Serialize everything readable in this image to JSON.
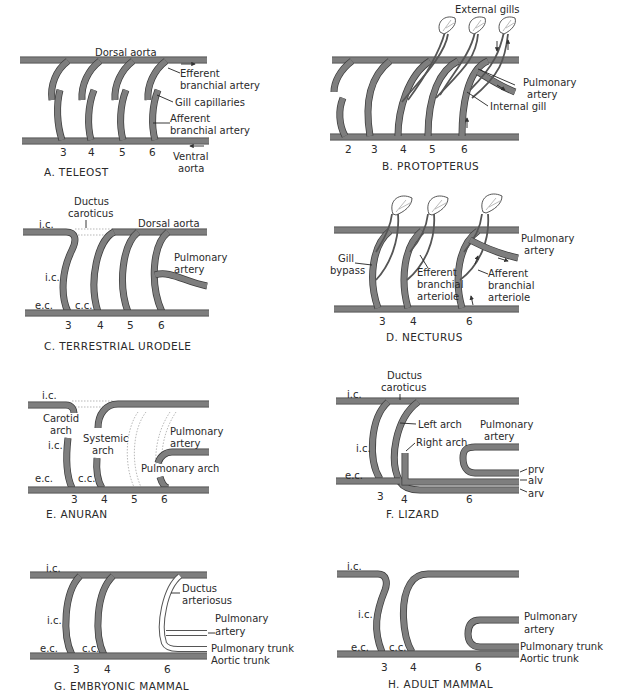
{
  "figure": {
    "vessel_color": "#7e7e7e",
    "panels": [
      {
        "id": "A",
        "caption": "A. TELEOST",
        "arch_numbers": [
          "3",
          "4",
          "5",
          "6"
        ],
        "labels": {
          "dorsal_aorta": "Dorsal aorta",
          "efferent_1": "Efferent",
          "efferent_2": "branchial artery",
          "gill_capillaries": "Gill capillaries",
          "afferent_1": "Afferent",
          "afferent_2": "branchial artery",
          "ventral_1": "Ventral",
          "ventral_2": "aorta"
        }
      },
      {
        "id": "B",
        "caption": "B. PROTOPTERUS",
        "arch_numbers": [
          "2",
          "3",
          "4",
          "5",
          "6"
        ],
        "labels": {
          "external_gills": "External gills",
          "pulmonary_1": "Pulmonary",
          "pulmonary_2": "artery",
          "internal_gill": "Internal gill"
        }
      },
      {
        "id": "C",
        "caption": "C. TERRESTRIAL URODELE",
        "arch_numbers": [
          "3",
          "4",
          "5",
          "6"
        ],
        "labels": {
          "ductus_1": "Ductus",
          "ductus_2": "caroticus",
          "dorsal_aorta": "Dorsal aorta",
          "ic_top": "i.c.",
          "ic_mid": "i.c.",
          "ec": "e.c.",
          "cc": "c.c.",
          "pulmonary_1": "Pulmonary",
          "pulmonary_2": "artery"
        }
      },
      {
        "id": "D",
        "caption": "D. NECTURUS",
        "arch_numbers": [
          "3",
          "4",
          "6"
        ],
        "labels": {
          "gill_bypass_1": "Gill",
          "gill_bypass_2": "bypass",
          "efferent_1": "Efferent",
          "efferent_2": "branchial",
          "efferent_3": "arteriole",
          "afferent_1": "Afferent",
          "afferent_2": "branchial",
          "afferent_3": "arteriole",
          "pulmonary_1": "Pulmonary",
          "pulmonary_2": "artery"
        }
      },
      {
        "id": "E",
        "caption": "E. ANURAN",
        "arch_numbers": [
          "3",
          "4",
          "5",
          "6"
        ],
        "labels": {
          "ic_top": "i.c.",
          "carotid_1": "Carotid",
          "carotid_2": "arch",
          "ic_mid": "i.c.",
          "systemic_1": "Systemic",
          "systemic_2": "arch",
          "ec": "e.c.",
          "cc": "c.c.",
          "pulmonary_1": "Pulmonary",
          "pulmonary_2": "artery",
          "pulmonary_arch": "Pulmonary arch"
        }
      },
      {
        "id": "F",
        "caption": "F. LIZARD",
        "arch_numbers": [
          "3",
          "4",
          "6"
        ],
        "labels": {
          "ductus_1": "Ductus",
          "ductus_2": "caroticus",
          "ic_top": "i.c.",
          "ic_mid": "i.c.",
          "ec": "e.c.",
          "left_arch": "Left arch",
          "right_arch": "Right arch",
          "pulmonary_1": "Pulmonary",
          "pulmonary_2": "artery",
          "prv": "prv",
          "alv": "alv",
          "arv": "arv"
        }
      },
      {
        "id": "G",
        "caption": "G. EMBRYONIC MAMMAL",
        "arch_numbers": [
          "3",
          "4",
          "6"
        ],
        "labels": {
          "ic_top": "i.c.",
          "ic_mid": "i.c.",
          "ec": "e.c.",
          "cc": "c.c.",
          "ductus_1": "Ductus",
          "ductus_2": "arteriosus",
          "pulmonary_1": "Pulmonary",
          "pulmonary_2": "artery",
          "pulmonary_trunk": "Pulmonary trunk",
          "aortic_trunk": "Aortic trunk"
        }
      },
      {
        "id": "H",
        "caption": "H. ADULT MAMMAL",
        "arch_numbers": [
          "3",
          "4",
          "6"
        ],
        "labels": {
          "ic_top": "i.c.",
          "ic_mid": "i.c.",
          "ec": "e.c.",
          "cc": "c.c.",
          "pulmonary_1": "Pulmonary",
          "pulmonary_2": "artery",
          "pulmonary_trunk": "Pulmonary trunk",
          "aortic_trunk": "Aortic trunk"
        }
      }
    ]
  }
}
